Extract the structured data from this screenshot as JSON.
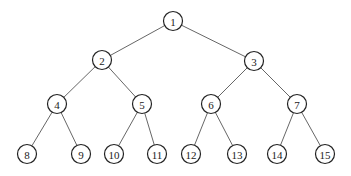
{
  "diagram": {
    "type": "binary-tree",
    "node_radius": 9.5,
    "colors": {
      "node_stroke": "#222222",
      "edge": "#555555",
      "background": "#ffffff"
    },
    "nodes": [
      {
        "id": 1,
        "label": "1",
        "x": 173,
        "y": 21
      },
      {
        "id": 2,
        "label": "2",
        "x": 102,
        "y": 60
      },
      {
        "id": 3,
        "label": "3",
        "x": 254,
        "y": 61
      },
      {
        "id": 4,
        "label": "4",
        "x": 57,
        "y": 104
      },
      {
        "id": 5,
        "label": "5",
        "x": 142,
        "y": 104
      },
      {
        "id": 6,
        "label": "6",
        "x": 211,
        "y": 104
      },
      {
        "id": 7,
        "label": "7",
        "x": 297,
        "y": 104
      },
      {
        "id": 8,
        "label": "8",
        "x": 27,
        "y": 154
      },
      {
        "id": 9,
        "label": "9",
        "x": 81,
        "y": 154
      },
      {
        "id": 10,
        "label": "10",
        "x": 114,
        "y": 154
      },
      {
        "id": 11,
        "label": "11",
        "x": 157,
        "y": 154
      },
      {
        "id": 12,
        "label": "12",
        "x": 191,
        "y": 154
      },
      {
        "id": 13,
        "label": "13",
        "x": 237,
        "y": 154
      },
      {
        "id": 14,
        "label": "14",
        "x": 277,
        "y": 154
      },
      {
        "id": 15,
        "label": "15",
        "x": 325,
        "y": 154
      }
    ],
    "edges": [
      [
        1,
        2
      ],
      [
        1,
        3
      ],
      [
        2,
        4
      ],
      [
        2,
        5
      ],
      [
        3,
        6
      ],
      [
        3,
        7
      ],
      [
        4,
        8
      ],
      [
        4,
        9
      ],
      [
        5,
        10
      ],
      [
        5,
        11
      ],
      [
        6,
        12
      ],
      [
        6,
        13
      ],
      [
        7,
        14
      ],
      [
        7,
        15
      ]
    ]
  }
}
